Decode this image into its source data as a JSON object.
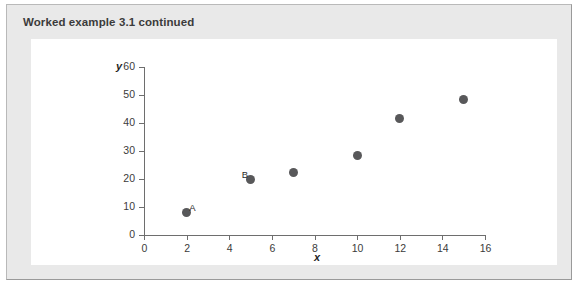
{
  "panel": {
    "header": "Worked example 3.1 continued",
    "background_color": "#e9e9e9",
    "border_color": "#b9b9b9",
    "figure_background": "#ffffff"
  },
  "chart_data": {
    "type": "scatter",
    "title": "",
    "xlabel": "x",
    "ylabel": "y",
    "xlim": [
      0,
      16
    ],
    "ylim": [
      0,
      60
    ],
    "xticks": [
      0,
      2,
      4,
      6,
      8,
      10,
      12,
      14,
      16
    ],
    "yticks": [
      0,
      10,
      20,
      30,
      40,
      50,
      60
    ],
    "xticklabels": [
      "0",
      "2",
      "4",
      "6",
      "8",
      "10",
      "12",
      "14",
      "16"
    ],
    "yticklabels": [
      "0",
      "10",
      "20",
      "30",
      "40",
      "50",
      "60"
    ],
    "grid": false,
    "legend": null,
    "marker_color": "#58585a",
    "axis_color": "#6e6e6e",
    "points": [
      {
        "x": 2,
        "y": 8,
        "label": "A",
        "label_side": "right"
      },
      {
        "x": 5,
        "y": 20,
        "label": "B",
        "label_side": "left"
      },
      {
        "x": 7,
        "y": 22.5,
        "label": "",
        "label_side": "right"
      },
      {
        "x": 10,
        "y": 28.5,
        "label": "",
        "label_side": "right"
      },
      {
        "x": 12,
        "y": 41.5,
        "label": "",
        "label_side": "right"
      },
      {
        "x": 15,
        "y": 48.5,
        "label": "",
        "label_side": "right"
      }
    ]
  }
}
